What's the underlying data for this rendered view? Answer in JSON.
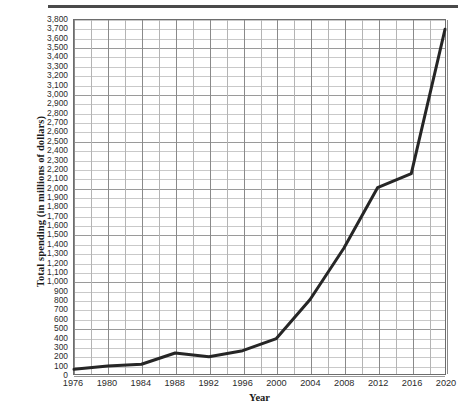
{
  "chart_data": {
    "type": "line",
    "title": "",
    "xlabel": "Year",
    "ylabel": "Total spending (in millions of dollars)",
    "x": [
      1976,
      1980,
      1984,
      1988,
      1992,
      1996,
      2000,
      2004,
      2008,
      2012,
      2016,
      2020
    ],
    "values": [
      50,
      85,
      105,
      225,
      185,
      250,
      380,
      800,
      1350,
      2000,
      2150,
      3700
    ],
    "series": [
      {
        "name": "Total spending",
        "values": [
          50,
          85,
          105,
          225,
          185,
          250,
          380,
          800,
          1350,
          2000,
          2150,
          3700
        ]
      }
    ],
    "categories": [
      "1976",
      "1980",
      "1984",
      "1988",
      "1992",
      "1996",
      "2000",
      "2004",
      "2008",
      "2012",
      "2016",
      "2020"
    ],
    "xlim": [
      1976,
      2020
    ],
    "ylim": [
      0,
      3800
    ],
    "ytick_step": 100,
    "xtick_step": 4,
    "grid": true,
    "legend": "none",
    "line_color": "#262626",
    "line_width": 3,
    "ytick_labels": [
      "3,800",
      "3,700",
      "3,600",
      "3,500",
      "3,400",
      "3,300",
      "3,200",
      "3,100",
      "3,000",
      "2,900",
      "2,800",
      "2,700",
      "2,600",
      "2,500",
      "2,400",
      "2,300",
      "2,200",
      "2,100",
      "2,000",
      "1,900",
      "1,800",
      "1,700",
      "1,600",
      "1,500",
      "1,400",
      "1,300",
      "1,200",
      "1,100",
      "1,000",
      "900",
      "800",
      "700",
      "600",
      "500",
      "400",
      "300",
      "200",
      "100",
      "0"
    ],
    "xtick_labels": [
      "1976",
      "1980",
      "1984",
      "1988",
      "1992",
      "1996",
      "2000",
      "2004",
      "2008",
      "2012",
      "2016",
      "2020"
    ]
  },
  "colors": {
    "line": "#262626",
    "grid_minor": "#c9c9c9",
    "grid_major": "#9a9a9a",
    "axis_border": "#6d6d6d",
    "top_rule": "#4a4a4a",
    "text": "#1a1a1a"
  }
}
